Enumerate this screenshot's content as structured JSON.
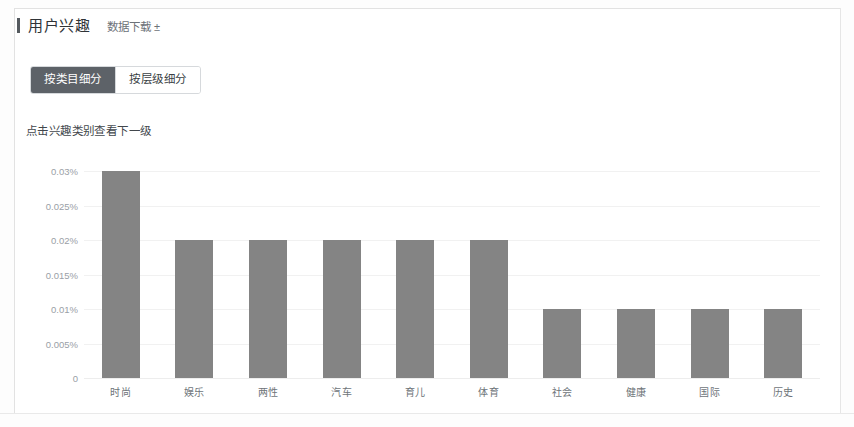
{
  "panel": {
    "title": "用户兴趣",
    "download_label": "数据下载",
    "download_icon": "download-icon-glyph",
    "download_glyph": "±"
  },
  "tabs": [
    {
      "label": "按类目细分",
      "active": true
    },
    {
      "label": "按层级细分",
      "active": false
    }
  ],
  "hint": "点击兴趣类别查看下一级",
  "chart_data": {
    "type": "bar",
    "title": "",
    "xlabel": "",
    "ylabel": "",
    "categories": [
      "时尚",
      "娱乐",
      "两性",
      "汽车",
      "育儿",
      "体育",
      "社会",
      "健康",
      "国际",
      "历史"
    ],
    "values": [
      0.03,
      0.02,
      0.02,
      0.02,
      0.02,
      0.02,
      0.01,
      0.01,
      0.01,
      0.01
    ],
    "value_unit": "%",
    "ylim": [
      0,
      0.03
    ],
    "yticks": [
      0.03,
      0.025,
      0.02,
      0.015,
      0.01,
      0.005,
      0
    ],
    "ytick_labels": [
      "0.03%",
      "0.025%",
      "0.02%",
      "0.015%",
      "0.01%",
      "0.005%",
      "0"
    ],
    "grid": true,
    "legend": "none",
    "bar_color": "#848484",
    "grid_color": "#f1f1f1",
    "axis_text_color": "#9aa0a6"
  },
  "colors": {
    "accent": "#555a5f",
    "tab_active_bg": "#5d6268",
    "card_border": "#e2e2e2"
  }
}
